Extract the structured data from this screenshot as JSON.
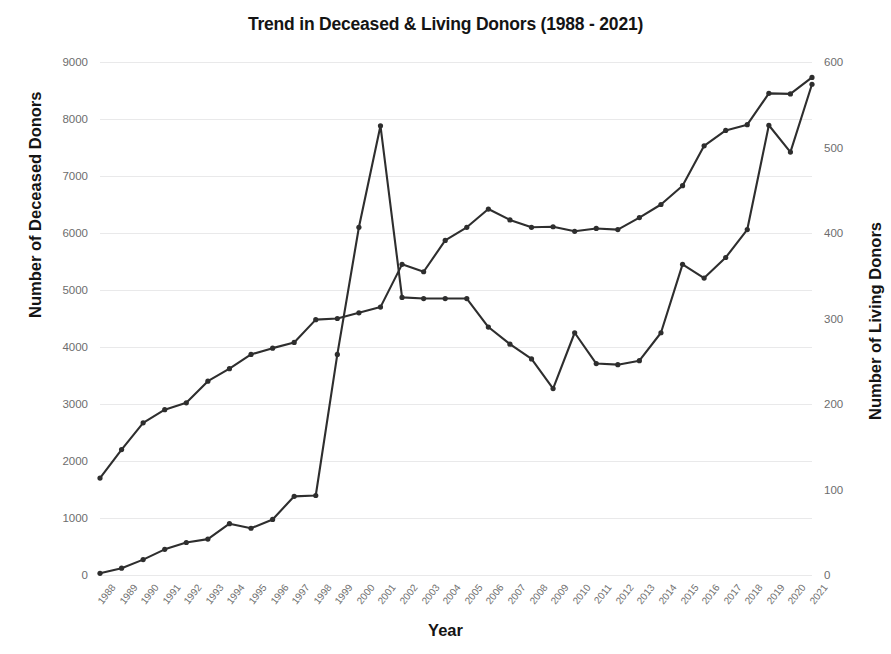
{
  "chart_data": {
    "type": "line",
    "title": "Trend in Deceased & Living Donors (1988 - 2021)",
    "xlabel": "Year",
    "ylabel": "Number of Deceased Donors",
    "ylabel_secondary": "Number of Living Donors",
    "grid": true,
    "legend": "none",
    "x": [
      "1988",
      "1989",
      "1990",
      "1991",
      "1992",
      "1993",
      "1994",
      "1995",
      "1996",
      "1997",
      "1998",
      "1999",
      "2000",
      "2001",
      "2002",
      "2003",
      "2004",
      "2005",
      "2006",
      "2007",
      "2008",
      "2009",
      "2010",
      "2011",
      "2012",
      "2013",
      "2014",
      "2015",
      "2016",
      "2017",
      "2018",
      "2019",
      "2020",
      "2021"
    ],
    "xtick_labels": [
      "1988",
      "1989",
      "1990",
      "1991",
      "1992",
      "1993",
      "1994",
      "1995",
      "1996",
      "1997",
      "1998",
      "1999",
      "2000",
      "2001",
      "2002",
      "2003",
      "2004",
      "2005",
      "2006",
      "2007",
      "2008",
      "2009",
      "2010",
      "2011",
      "2012",
      "2013",
      "2014",
      "2015",
      "2016",
      "2017",
      "2018",
      "2019",
      "2020",
      "2021"
    ],
    "ylim": [
      0,
      9000
    ],
    "yticks": [
      0,
      1000,
      2000,
      3000,
      4000,
      5000,
      6000,
      7000,
      8000,
      9000
    ],
    "ytick_labels": [
      "0",
      "1000",
      "2000",
      "3000",
      "4000",
      "5000",
      "6000",
      "7000",
      "8000",
      "9000"
    ],
    "ylim_secondary": [
      0,
      600
    ],
    "yticks_secondary": [
      0,
      100,
      200,
      300,
      400,
      500,
      600
    ],
    "ytick_labels_secondary": [
      "0",
      "100",
      "200",
      "300",
      "400",
      "500",
      "600"
    ],
    "series": [
      {
        "name": "Deceased Donors",
        "axis": "left",
        "values": [
          1700,
          2200,
          2670,
          2900,
          3020,
          3400,
          3620,
          3870,
          3980,
          4080,
          4480,
          4500,
          4600,
          4700,
          5450,
          5320,
          5870,
          6100,
          6420,
          6230,
          6100,
          6110,
          6030,
          6080,
          6060,
          6270,
          6500,
          6830,
          7530,
          7800,
          7900,
          8450,
          8440,
          8730
        ]
      },
      {
        "name": "Living Donors",
        "axis": "right",
        "values": [
          2,
          8,
          18,
          30,
          38,
          42,
          60,
          55,
          65,
          92,
          93,
          258,
          407,
          525,
          325,
          323,
          323,
          323,
          290,
          270,
          253,
          218,
          283,
          247,
          246,
          250,
          283,
          363,
          347,
          371,
          404,
          526,
          494,
          574
        ]
      }
    ],
    "living_donors_on_left_scale": [
      30,
      120,
      270,
      450,
      570,
      630,
      900,
      820,
      975,
      1380,
      1395,
      3870,
      6100,
      7880,
      4870,
      4850,
      4850,
      4850,
      4350,
      4050,
      3790,
      3270,
      4250,
      3710,
      3690,
      3760,
      4250,
      5450,
      5210,
      5570,
      6060,
      7890,
      7420,
      8610
    ]
  }
}
